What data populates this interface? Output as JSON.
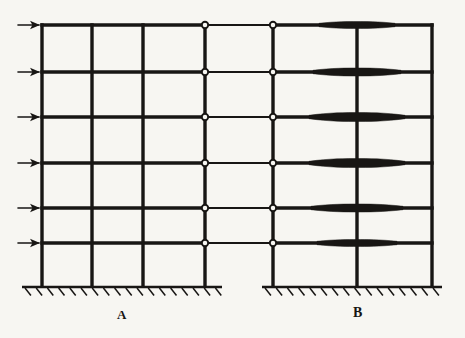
{
  "figure": {
    "kind": "structural-frame-elevation-diagram",
    "title": "",
    "background_color": "#f7f6f2",
    "ink_color": "#181614",
    "canvas": {
      "width": 465,
      "height": 338
    }
  },
  "labels": {
    "frame_a": "A",
    "frame_b": "B"
  },
  "chart_data": {
    "type": "diagram",
    "title": "",
    "xlabel": "",
    "ylabel": "",
    "stories": 6,
    "floor_levels_y": [
      25,
      72,
      117,
      163,
      208,
      243
    ],
    "base_y": 287,
    "frames": [
      {
        "name": "A",
        "label": "A",
        "label_x": 122,
        "column_x": [
          42,
          92,
          143,
          205
        ],
        "bays": 3,
        "ground_line": {
          "x1": 22,
          "x2": 222,
          "y": 287
        },
        "support": "fixed",
        "beam_type": "uniform"
      },
      {
        "name": "B",
        "label": "B",
        "label_x": 358,
        "column_x": [
          273,
          357,
          432
        ],
        "bays": 2,
        "ground_line": {
          "x1": 262,
          "x2": 442,
          "y": 287
        },
        "support": "fixed",
        "beam_type": "haunched-at-interior-column"
      }
    ],
    "link_beams": {
      "from_x": 205,
      "to_x": 273,
      "end_condition": "pinned",
      "hinge_marker": "open-circle",
      "count": 6
    },
    "haunches": {
      "center_x": 357,
      "shape": "spindle",
      "half_lengths": [
        38,
        44,
        48,
        48,
        46,
        40
      ],
      "max_thickness": [
        7,
        8,
        9,
        9,
        8,
        7
      ]
    },
    "lateral_loads": {
      "count": 6,
      "direction": "right",
      "applied_to": "frame-A-left-column",
      "arrow_tail_x": 18,
      "arrow_head_x": 42,
      "y": [
        25,
        72,
        117,
        163,
        208,
        243
      ]
    },
    "line_weights": {
      "beam": 3.4,
      "column": 3.4,
      "link_beam": 2.2,
      "ground": 2.4,
      "hatch": 1.5,
      "arrow": 1.6
    }
  }
}
